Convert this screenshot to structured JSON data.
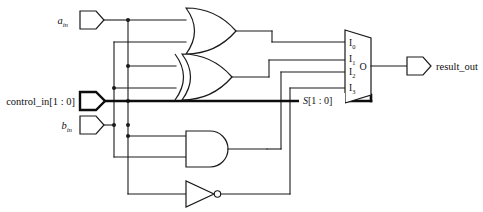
{
  "diagram": {
    "type": "logic-schematic",
    "background_color": "#ffffff",
    "line_color": "#1a1a1a"
  },
  "inputs": [
    {
      "id": "a_in",
      "base": "a",
      "subscript": "in",
      "bus": false,
      "label_full": "a_in"
    },
    {
      "id": "control_in",
      "base": "control_in",
      "range": "[1 : 0]",
      "bus": true,
      "label_full": "control_in[1 : 0]"
    },
    {
      "id": "b_in",
      "base": "b",
      "subscript": "in",
      "bus": false,
      "label_full": "b_in"
    }
  ],
  "outputs": [
    {
      "id": "result_out",
      "label": "result_out",
      "bus": false
    }
  ],
  "gates": [
    {
      "id": "or1",
      "type": "OR",
      "inputs": [
        "a_in",
        "b_in"
      ],
      "output_to": "mux.I0"
    },
    {
      "id": "xor1",
      "type": "XOR",
      "inputs": [
        "a_in",
        "b_in"
      ],
      "output_to": "mux.I1"
    },
    {
      "id": "and1",
      "type": "AND",
      "inputs": [
        "a_in",
        "b_in"
      ],
      "output_to": "mux.I2"
    },
    {
      "id": "not1",
      "type": "NOT",
      "inputs": [
        "a_in"
      ],
      "output_to": "mux.I3"
    }
  ],
  "mux": {
    "name": "mux4to1",
    "inputs": [
      {
        "label": "I",
        "subscript": "0"
      },
      {
        "label": "I",
        "subscript": "1"
      },
      {
        "label": "I",
        "subscript": "2"
      },
      {
        "label": "I",
        "subscript": "3"
      }
    ],
    "output_label": "O",
    "select_label": "S",
    "select_range": "[1 : 0]",
    "select_label_full": "S[1 : 0]",
    "select_source": "control_in"
  }
}
